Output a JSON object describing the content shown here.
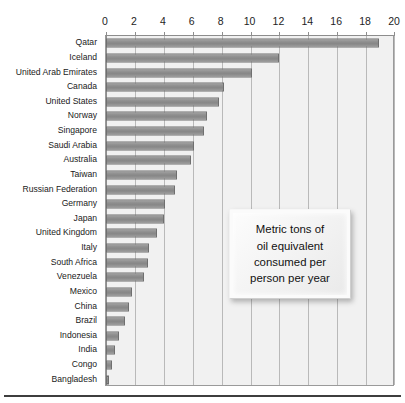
{
  "chart_data": {
    "type": "bar",
    "orientation": "horizontal",
    "title": "",
    "subtitle": "",
    "xlabel": "",
    "ylabel": "",
    "xlim": [
      0,
      20
    ],
    "ylim": null,
    "grid": true,
    "legend": null,
    "xticks": [
      0,
      2,
      4,
      6,
      8,
      10,
      12,
      14,
      16,
      18,
      20
    ],
    "xtick_labels": [
      "0",
      "2",
      "4",
      "6",
      "8",
      "10",
      "12",
      "14",
      "16",
      "18",
      "20"
    ],
    "categories": [
      "Qatar",
      "Iceland",
      "United Arab Emirates",
      "Canada",
      "United States",
      "Norway",
      "Singapore",
      "Saudi Arabia",
      "Australia",
      "Taiwan",
      "Russian Federation",
      "Germany",
      "Japan",
      "United Kingdom",
      "Italy",
      "South Africa",
      "Venezuela",
      "Mexico",
      "China",
      "Brazil",
      "Indonesia",
      "India",
      "Congo",
      "Bangladesh"
    ],
    "values": [
      18.9,
      12.0,
      10.1,
      8.2,
      7.8,
      7.0,
      6.8,
      6.1,
      5.9,
      4.9,
      4.8,
      4.1,
      4.0,
      3.5,
      3.0,
      2.9,
      2.6,
      1.8,
      1.6,
      1.3,
      0.9,
      0.6,
      0.4,
      0.2
    ],
    "annotations": [
      {
        "name": "units-callout",
        "text": "Metric tons of\noil equivalent\nconsumed per\nperson per year"
      }
    ],
    "colors": {
      "bar_fill": "#8e8e8e",
      "bar_border": "#6f6f6f",
      "plot_background": "#f1f1f1",
      "gridline": "#b9b9b9",
      "axis_line": "#8d8d8d",
      "text": "#1a1a1a",
      "page_background": "#ffffff",
      "rule": "#3e3e3e"
    }
  }
}
